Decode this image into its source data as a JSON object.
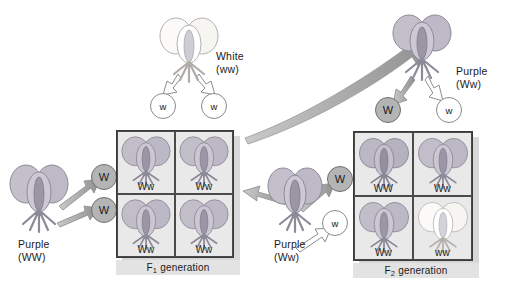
{
  "diagram": {
    "colors": {
      "purple_petal": "#b9b5c4",
      "white_petal": "#f7f6f4",
      "allele_gray": "#b4b4b4",
      "allele_white": "#ffffff",
      "square_bg": "#e9e9e9",
      "square_border": "#3a3a3a",
      "gen_bar_bg": "#e3e3e3",
      "arrow_gray": "#9c9c9c",
      "arrow_white": "#ffffff"
    }
  },
  "parents": {
    "left": {
      "phenotype": "Purple",
      "genotype": "(WW)",
      "label": "Purple\n(WW)",
      "gametes": [
        {
          "allele": "W",
          "style": "gray"
        },
        {
          "allele": "W",
          "style": "gray"
        }
      ]
    },
    "top": {
      "phenotype": "White",
      "genotype": "(ww)",
      "label": "White\n(ww)",
      "gametes": [
        {
          "allele": "w",
          "style": "white"
        },
        {
          "allele": "w",
          "style": "white"
        }
      ]
    },
    "middle": {
      "phenotype": "Purple",
      "genotype": "(Ww)",
      "label": "Purple\n(Ww)",
      "gametes": [
        {
          "allele": "W",
          "style": "gray"
        },
        {
          "allele": "w",
          "style": "white"
        }
      ]
    },
    "top_right": {
      "phenotype": "Purple",
      "genotype": "(Ww)",
      "label": "Purple\n(Ww)",
      "gametes": [
        {
          "allele": "W",
          "style": "gray"
        },
        {
          "allele": "w",
          "style": "white"
        }
      ]
    }
  },
  "f1": {
    "caption": "F",
    "caption_sub": "1",
    "caption_rest": " generation",
    "cells": [
      {
        "genotype": "Ww",
        "color": "purple"
      },
      {
        "genotype": "Ww",
        "color": "purple"
      },
      {
        "genotype": "Ww",
        "color": "purple"
      },
      {
        "genotype": "Ww",
        "color": "purple"
      }
    ]
  },
  "f2": {
    "caption": "F",
    "caption_sub": "2",
    "caption_rest": " generation",
    "cells": [
      {
        "genotype": "WW",
        "color": "purple"
      },
      {
        "genotype": "Ww",
        "color": "purple"
      },
      {
        "genotype": "Ww",
        "color": "purple"
      },
      {
        "genotype": "ww",
        "color": "white"
      }
    ]
  }
}
